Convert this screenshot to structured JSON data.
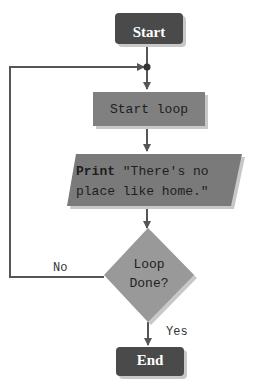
{
  "diagram": {
    "type": "flowchart",
    "colors": {
      "terminal_fill": "#4a4a4a",
      "process_fill": "#808080",
      "io_fill": "#7a7a7a",
      "decision_fill": "#999999",
      "line": "#555555",
      "shadow": "#c8c8c8"
    },
    "nodes": {
      "start": {
        "shape": "rounded-rect",
        "label": "Start"
      },
      "start_loop": {
        "shape": "rectangle",
        "label": "Start loop"
      },
      "print": {
        "shape": "parallelogram",
        "keyword": "Print",
        "line1": " \"There's no",
        "line2": "place like home.\""
      },
      "decision": {
        "shape": "diamond",
        "line1": "Loop",
        "line2": "Done?"
      },
      "end": {
        "shape": "rounded-rect",
        "label": "End"
      }
    },
    "edges": [
      {
        "from": "start",
        "to": "start_loop"
      },
      {
        "from": "start_loop",
        "to": "print"
      },
      {
        "from": "print",
        "to": "decision"
      },
      {
        "from": "decision",
        "to": "end",
        "label": "Yes"
      },
      {
        "from": "decision",
        "to": "start_loop",
        "label": "No"
      }
    ],
    "edge_labels": {
      "yes": "Yes",
      "no": "No"
    }
  }
}
